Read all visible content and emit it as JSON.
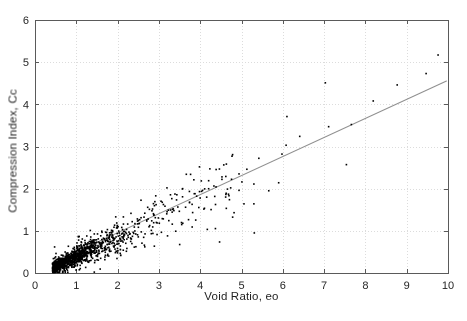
{
  "figure": {
    "background": "#ffffff"
  },
  "chart_data": {
    "type": "scatter",
    "title": "",
    "xlabel": "Void Ratio, eo",
    "ylabel": "Compression Index, Cc",
    "xlim": [
      0,
      10
    ],
    "ylim": [
      0,
      6
    ],
    "xticks": [
      0,
      1,
      2,
      3,
      4,
      5,
      6,
      7,
      8,
      9,
      10
    ],
    "yticks": [
      0,
      1,
      2,
      3,
      4,
      5,
      6
    ],
    "grid": true,
    "grid_color": "#dcdcdc",
    "frame_color": "#5a5a5a",
    "tick_label_color": "#262626",
    "marker": {
      "shape": "dot",
      "color": "#000000",
      "size_px": 1.6
    },
    "regression_line": {
      "slope": 0.452,
      "intercept": 0.05,
      "x_start": 1.0,
      "x_end": 9.97,
      "color": "#8f8f8f",
      "width_px": 1
    },
    "cloud_generator": {
      "seed": 11,
      "n": 1250,
      "x_mixture": [
        {
          "w": 0.6,
          "type": "halfnormal",
          "base": 0.42,
          "scale": 0.5
        },
        {
          "w": 0.28,
          "type": "halfnormal",
          "base": 0.95,
          "scale": 0.85
        },
        {
          "w": 0.12,
          "type": "uniform",
          "base": 1.7,
          "scale": 3.1
        }
      ],
      "x_range": [
        0.33,
        4.85
      ],
      "y_model": {
        "slope": 0.44,
        "intercept": -0.055,
        "sigma_base": 0.04,
        "sigma_per_x": 0.07,
        "wide_tail_prob": 0.13,
        "wide_tail_mult": 1.9
      },
      "y_range": [
        0.015,
        5.5
      ]
    },
    "sparse_points": [
      [
        4.77,
        2.77
      ],
      [
        4.94,
        2.35
      ],
      [
        5.01,
        2.16
      ],
      [
        4.94,
        1.96
      ],
      [
        5.42,
        2.72
      ],
      [
        5.98,
        2.82
      ],
      [
        5.13,
        2.46
      ],
      [
        5.3,
        2.11
      ],
      [
        5.9,
        2.14
      ],
      [
        5.66,
        1.95
      ],
      [
        5.3,
        1.64
      ],
      [
        5.06,
        1.64
      ],
      [
        4.82,
        1.43
      ],
      [
        5.31,
        0.95
      ],
      [
        6.41,
        3.24
      ],
      [
        6.08,
        3.03
      ],
      [
        6.1,
        3.71
      ],
      [
        7.11,
        3.47
      ],
      [
        7.66,
        3.52
      ],
      [
        7.03,
        4.51
      ],
      [
        8.19,
        4.08
      ],
      [
        8.77,
        4.46
      ],
      [
        9.76,
        5.17
      ],
      [
        9.47,
        4.73
      ],
      [
        7.54,
        2.57
      ]
    ]
  }
}
